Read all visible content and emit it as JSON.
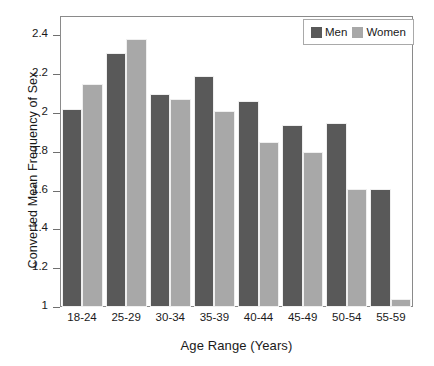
{
  "chart_data": {
    "type": "bar",
    "title": "",
    "subtitle": "",
    "xlabel": "Age Range (Years)",
    "ylabel": "Converted Mean Frequency of Sex",
    "categories": [
      "18-24",
      "25-29",
      "30-34",
      "35-39",
      "40-44",
      "45-49",
      "50-54",
      "55-59"
    ],
    "series": [
      {
        "name": "Men",
        "color": "#595959",
        "values": [
          2.02,
          2.31,
          2.1,
          2.19,
          2.06,
          1.94,
          1.95,
          1.61
        ]
      },
      {
        "name": "Women",
        "color": "#a8a8a8",
        "values": [
          2.15,
          2.38,
          2.07,
          2.01,
          1.85,
          1.8,
          1.61,
          1.04
        ]
      }
    ],
    "ylim": [
      1,
      2.5
    ],
    "yticks": [
      1,
      1.2,
      1.4,
      1.6,
      1.8,
      2,
      2.2,
      2.4
    ],
    "ytick_labels": [
      "1",
      "1.2",
      "1.4",
      "1.6",
      "1.8",
      "2",
      "2.2",
      "2.4"
    ],
    "grid": false,
    "legend_position": "top-right",
    "legend_entries": [
      "Men",
      "Women"
    ]
  },
  "axes": {
    "y_title": "Converted Mean Frequency of Sex",
    "x_title": "Age Range (Years)"
  },
  "legend": {
    "men_label": "Men",
    "women_label": "Women"
  }
}
